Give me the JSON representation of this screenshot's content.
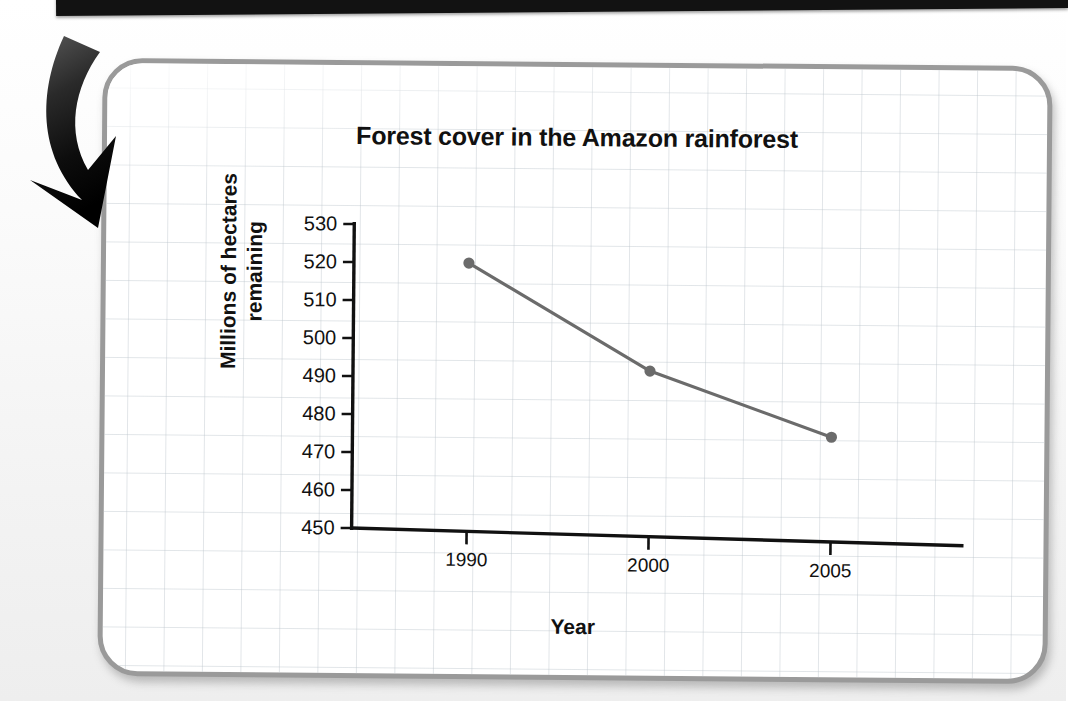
{
  "page": {
    "background_color": "#f4f4f4",
    "card_border_color": "#9a9a9a"
  },
  "annotation": {
    "arrow_icon": "curved-down-right-arrow",
    "arrow_color": "#111111"
  },
  "chart_data": {
    "type": "line",
    "title": "Forest cover in the Amazon rainforest",
    "xlabel": "Year",
    "ylabel_line1": "Millions of hectares",
    "ylabel_line2": "remaining",
    "ylabel": "Millions of hectares remaining",
    "categories": [
      "1990",
      "2000",
      "2005"
    ],
    "x": [
      1990,
      2000,
      2005
    ],
    "values": [
      520,
      492,
      475
    ],
    "series": [
      {
        "name": "Forest cover",
        "values": [
          520,
          492,
          475
        ],
        "color": "#6b6b6b",
        "marker": "circle"
      }
    ],
    "ylim": [
      450,
      530
    ],
    "yticks": [
      530,
      520,
      510,
      500,
      490,
      480,
      470,
      460,
      450
    ],
    "xticks": [
      "1990",
      "2000",
      "2005"
    ],
    "grid": true,
    "grid_style": "graph-paper-background",
    "legend": "none",
    "line_color": "#6b6b6b",
    "axis_color": "#111111"
  }
}
